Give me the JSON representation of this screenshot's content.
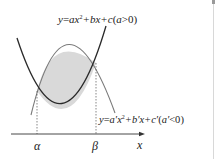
{
  "diagram": {
    "upper_curve_label": {
      "prefix": "y",
      "eq": "=",
      "body": "ax",
      "sup": "2",
      "rest": "+bx+c",
      "cond_open": "(",
      "cond": "a",
      "cond_rel": ">0",
      "cond_close": ")"
    },
    "lower_curve_label": {
      "prefix": "y",
      "eq": "=",
      "body": "a′x",
      "sup": "2",
      "rest": "+b′x+c′",
      "cond_open": "(",
      "cond": "a′",
      "cond_rel": "<0",
      "cond_close": ")"
    },
    "axis": {
      "x_label": "x",
      "alpha_label": "α",
      "beta_label": "β"
    },
    "colors": {
      "upward_parabola": "#2a2a2a",
      "downward_parabola": "#7a7a7a",
      "shaded_region": "#d9d9d9",
      "axis": "#333333",
      "dashed_guides": "#555555"
    }
  }
}
